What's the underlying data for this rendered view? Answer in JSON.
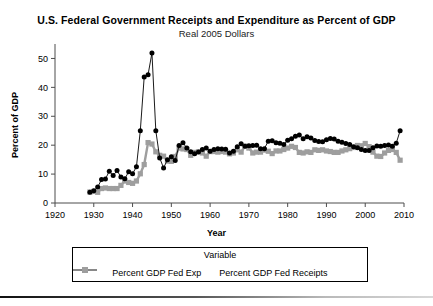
{
  "chart_data": {
    "type": "line",
    "title": "U.S. Federal Government Receipts and Expenditure as Percent of GDP",
    "subtitle": "Real 2005 Dollars",
    "xlabel": "Year",
    "ylabel": "Percent of GDP",
    "xlim": [
      1920,
      2010
    ],
    "ylim": [
      0,
      55
    ],
    "xticks": [
      "1920",
      "1930",
      "1940",
      "1950",
      "1960",
      "1970",
      "1980",
      "1990",
      "2000",
      "2010"
    ],
    "yticks": [
      "0",
      "10",
      "20",
      "30",
      "40",
      "50"
    ],
    "grid": false,
    "legend": {
      "title": "Variable",
      "position": "bottom",
      "entries": [
        {
          "name": "Percent GDP Fed Exp",
          "color": "#000000",
          "marker": "circle"
        },
        {
          "name": "Percent GDP Fed Receipts",
          "color": "#9e9e9e",
          "marker": "square"
        }
      ]
    },
    "x": [
      1929,
      1930,
      1931,
      1932,
      1933,
      1934,
      1935,
      1936,
      1937,
      1938,
      1939,
      1940,
      1941,
      1942,
      1943,
      1944,
      1945,
      1946,
      1947,
      1948,
      1949,
      1950,
      1951,
      1952,
      1953,
      1954,
      1955,
      1956,
      1957,
      1958,
      1959,
      1960,
      1961,
      1962,
      1963,
      1964,
      1965,
      1966,
      1967,
      1968,
      1969,
      1970,
      1971,
      1972,
      1973,
      1974,
      1975,
      1976,
      1977,
      1978,
      1979,
      1980,
      1981,
      1982,
      1983,
      1984,
      1985,
      1986,
      1987,
      1988,
      1989,
      1990,
      1991,
      1992,
      1993,
      1994,
      1995,
      1996,
      1997,
      1998,
      1999,
      2000,
      2001,
      2002,
      2003,
      2004,
      2005,
      2006,
      2007,
      2008,
      2009
    ],
    "series": [
      {
        "name": "Percent GDP Fed Exp",
        "color": "#000000",
        "marker": "circle",
        "values": [
          3.7,
          4.2,
          5.5,
          8.1,
          8.3,
          11.0,
          9.5,
          11.2,
          9.0,
          8.4,
          10.8,
          10.1,
          12.5,
          25.0,
          43.6,
          44.4,
          51.9,
          25.0,
          15.6,
          12.1,
          15.0,
          16.0,
          14.7,
          19.9,
          20.8,
          19.0,
          17.7,
          17.0,
          17.6,
          18.5,
          19.0,
          17.9,
          18.5,
          18.8,
          18.7,
          18.6,
          17.3,
          17.9,
          19.5,
          20.5,
          19.6,
          19.8,
          19.9,
          20.0,
          18.8,
          18.8,
          21.4,
          21.5,
          20.8,
          20.7,
          20.2,
          21.7,
          22.2,
          23.1,
          23.5,
          22.2,
          22.9,
          22.5,
          21.6,
          21.3,
          21.2,
          21.9,
          22.3,
          22.1,
          21.4,
          21.0,
          20.6,
          20.2,
          19.5,
          19.1,
          18.5,
          18.2,
          18.2,
          19.1,
          19.7,
          19.6,
          19.9,
          20.1,
          19.6,
          20.7,
          25.0
        ]
      },
      {
        "name": "Percent GDP Fed Receipts",
        "color": "#9e9e9e",
        "marker": "square",
        "values": [
          3.8,
          4.0,
          3.7,
          5.0,
          5.2,
          5.0,
          5.0,
          5.0,
          6.1,
          7.6,
          7.1,
          6.8,
          7.6,
          10.1,
          13.3,
          20.9,
          20.4,
          17.7,
          16.5,
          16.2,
          14.5,
          14.4,
          16.1,
          19.0,
          18.7,
          18.5,
          16.5,
          17.5,
          17.7,
          17.3,
          16.2,
          17.8,
          17.8,
          17.6,
          17.8,
          17.6,
          17.0,
          17.3,
          18.4,
          17.6,
          19.7,
          19.0,
          17.3,
          17.6,
          17.6,
          18.3,
          17.9,
          17.1,
          18.0,
          18.0,
          18.5,
          19.0,
          19.6,
          19.2,
          17.5,
          17.3,
          17.7,
          17.5,
          18.4,
          18.2,
          18.4,
          18.0,
          17.8,
          17.5,
          17.5,
          18.0,
          18.4,
          18.8,
          19.2,
          19.9,
          19.8,
          20.6,
          19.5,
          17.6,
          16.2,
          16.1,
          17.3,
          18.2,
          18.5,
          17.5,
          14.8
        ]
      }
    ]
  }
}
